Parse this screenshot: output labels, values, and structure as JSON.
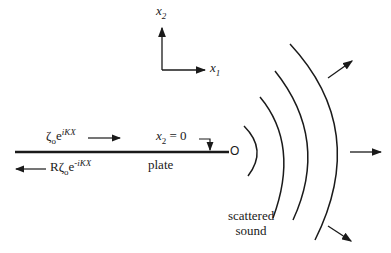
{
  "diagram": {
    "axes": {
      "vertical_label": "x",
      "vertical_sub": "2",
      "horizontal_label": "x",
      "horizontal_sub": "1"
    },
    "incident_wave": {
      "symbol": "ζ",
      "sub": "o",
      "base": "e",
      "exponent": "iKX"
    },
    "reflected_wave": {
      "prefix": "R",
      "symbol": "ζ",
      "sub": "o",
      "base": "e",
      "exponent": "-iKX"
    },
    "plate_label": "plate",
    "surface_label": {
      "var": "x",
      "sub": "2",
      "eq": " = 0"
    },
    "origin_label": "O",
    "scattered_label": [
      "scattered",
      "sound"
    ],
    "colors": {
      "ink": "#1a1a1a",
      "background": "#ffffff"
    }
  }
}
